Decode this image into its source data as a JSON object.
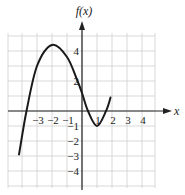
{
  "chart_data": {
    "type": "line",
    "title": "",
    "xlabel": "x",
    "ylabel": "f(x)",
    "xlim": [
      -5,
      5
    ],
    "ylim": [
      -5,
      5
    ],
    "grid": true,
    "x_tick_labels": [
      "-3",
      "-2",
      "-1",
      "1",
      "2",
      "3",
      "4"
    ],
    "y_tick_labels": [
      "4",
      "2",
      "-1",
      "-2",
      "-3",
      "-4"
    ],
    "series": [
      {
        "name": "f(x)",
        "x": [
          -4.2,
          -3.7,
          -3.0,
          -2.0,
          -1.0,
          -0.3,
          0.0,
          0.4,
          1.0,
          1.6,
          1.9
        ],
        "y": [
          -2.9,
          0.0,
          3.0,
          4.4,
          3.6,
          2.0,
          1.2,
          0.0,
          -1.0,
          0.0,
          0.9
        ]
      }
    ],
    "colors": {
      "curve": "#1a1a1a",
      "grid": "#cfcfcf",
      "axis": "#222222"
    }
  },
  "labels": {
    "y_axis_title": "f(x)",
    "x_axis_title": "x",
    "x_ticks": [
      {
        "text": "−3",
        "x": -3
      },
      {
        "text": "−2",
        "x": -2
      },
      {
        "text": "−1",
        "x": -1
      },
      {
        "text": "1",
        "x": 1
      },
      {
        "text": "2",
        "x": 2
      },
      {
        "text": "3",
        "x": 3
      },
      {
        "text": "4",
        "x": 4
      }
    ],
    "y_ticks": [
      {
        "text": "4",
        "y": 4
      },
      {
        "text": "2",
        "y": 2
      },
      {
        "text": "−1",
        "y": -1
      },
      {
        "text": "−2",
        "y": -2
      },
      {
        "text": "−3",
        "y": -3
      },
      {
        "text": "−4",
        "y": -4
      }
    ]
  }
}
